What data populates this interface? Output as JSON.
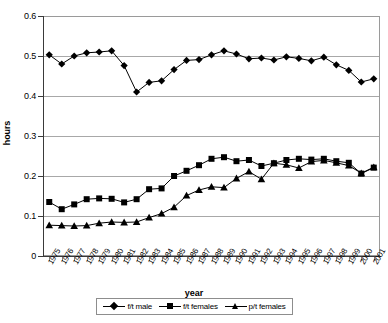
{
  "chart_data": {
    "type": "line",
    "title": "",
    "xlabel": "year",
    "ylabel": "hours",
    "ylim": [
      0,
      0.6
    ],
    "ytick_labels": [
      "0.6",
      "0.5",
      "0.4",
      "0.3",
      "0.2",
      "0.1",
      "0"
    ],
    "ytick_values": [
      0.6,
      0.5,
      0.4,
      0.3,
      0.2,
      0.1,
      0
    ],
    "grid": true,
    "legend_position": "bottom",
    "categories": [
      "1975",
      "1976",
      "1977",
      "1978",
      "1979",
      "1980",
      "1981",
      "1982",
      "1983",
      "1984",
      "1985",
      "1986",
      "1987",
      "1988",
      "1989",
      "1990",
      "1991",
      "1992",
      "1993",
      "1994",
      "1995",
      "1996",
      "1997",
      "1998",
      "1999",
      "2000",
      "2001"
    ],
    "x": [
      1975,
      1976,
      1977,
      1978,
      1979,
      1980,
      1981,
      1982,
      1983,
      1984,
      1985,
      1986,
      1987,
      1988,
      1989,
      1990,
      1991,
      1992,
      1993,
      1994,
      1995,
      1996,
      1997,
      1998,
      1999,
      2000,
      2001
    ],
    "series": [
      {
        "name": "f/t male",
        "marker": "diamond",
        "values": [
          0.503,
          0.48,
          0.5,
          0.508,
          0.51,
          0.513,
          0.476,
          0.41,
          0.434,
          0.438,
          0.466,
          0.489,
          0.491,
          0.503,
          0.513,
          0.505,
          0.493,
          0.495,
          0.49,
          0.498,
          0.494,
          0.488,
          0.497,
          0.478,
          0.464,
          0.435,
          0.443
        ]
      },
      {
        "name": "f/t females",
        "marker": "square",
        "values": [
          0.135,
          0.117,
          0.129,
          0.142,
          0.144,
          0.143,
          0.134,
          0.142,
          0.167,
          0.169,
          0.2,
          0.213,
          0.227,
          0.243,
          0.247,
          0.237,
          0.24,
          0.225,
          0.232,
          0.24,
          0.243,
          0.241,
          0.243,
          0.237,
          0.233,
          0.206,
          0.221
        ]
      },
      {
        "name": "p/t females",
        "marker": "triangle",
        "values": [
          0.077,
          0.076,
          0.075,
          0.076,
          0.082,
          0.085,
          0.084,
          0.085,
          0.096,
          0.106,
          0.122,
          0.151,
          0.165,
          0.173,
          0.171,
          0.194,
          0.211,
          0.192,
          0.232,
          0.228,
          0.22,
          0.236,
          0.239,
          0.233,
          0.226,
          0.207,
          0.222
        ]
      }
    ]
  },
  "legend": {
    "items": [
      {
        "label": "f/t male",
        "marker": "diamond"
      },
      {
        "label": "f/t females",
        "marker": "square"
      },
      {
        "label": "p/t females",
        "marker": "triangle"
      }
    ]
  },
  "axes": {
    "y_title": "hours",
    "x_title": "year"
  }
}
